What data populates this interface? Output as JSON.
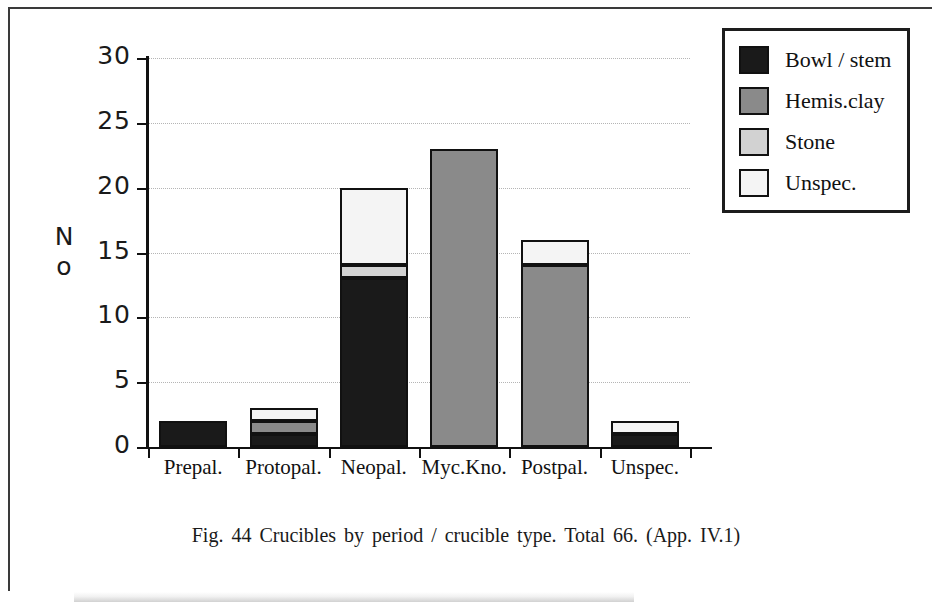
{
  "caption": {
    "text": "Fig. 44  Crucibles  by  period / crucible  type. Total 66. (App. IV.1)"
  },
  "axis": {
    "y_title_line1": "N",
    "y_title_line2": "o"
  },
  "legend": {
    "items": [
      {
        "label": "Bowl / stem",
        "color": "#1a1a1a"
      },
      {
        "label": "Hemis.clay",
        "color": "#8a8a8a"
      },
      {
        "label": "Stone",
        "color": "#d2d2d2"
      },
      {
        "label": "Unspec.",
        "color": "#f4f4f4"
      }
    ]
  },
  "chart_data": {
    "type": "bar",
    "subtype": "stacked",
    "title": "Fig. 44  Crucibles  by  period / crucible  type. Total 66. (App. IV.1)",
    "xlabel": "",
    "ylabel": "No",
    "ylim": [
      0,
      30
    ],
    "ytick_labels": [
      "0",
      "5",
      "10",
      "15",
      "20",
      "25",
      "30"
    ],
    "ytick_values": [
      0,
      5,
      10,
      15,
      20,
      25,
      30
    ],
    "grid": true,
    "grid_axis": "y",
    "legend_position": "top-right",
    "total": 66,
    "categories": [
      "Prepal.",
      "Protopal.",
      "Neopal.",
      "Myc.Kno.",
      "Postpal.",
      "Unspec."
    ],
    "series": [
      {
        "name": "Bowl / stem",
        "color": "#1a1a1a",
        "values": [
          2,
          1,
          13,
          0,
          0,
          1
        ]
      },
      {
        "name": "Hemis.clay",
        "color": "#8a8a8a",
        "values": [
          0,
          1,
          0,
          23,
          14,
          0
        ]
      },
      {
        "name": "Stone",
        "color": "#d2d2d2",
        "values": [
          0,
          0,
          1,
          0,
          0,
          0
        ]
      },
      {
        "name": "Unspec.",
        "color": "#f4f4f4",
        "values": [
          0,
          1,
          6,
          0,
          2,
          1
        ]
      }
    ],
    "category_totals": [
      2,
      3,
      20,
      23,
      16,
      2
    ]
  }
}
